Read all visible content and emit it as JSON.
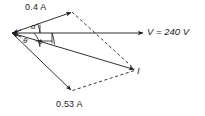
{
  "diagram": {
    "stroke_color": "#1a1a1a",
    "background": "#ffffff",
    "labels": {
      "branch_current_1": "0.4 A",
      "branch_current_2": "0.53 A",
      "voltage": "V = 240 V",
      "total_current": "I",
      "angle_alpha": "α",
      "angle_theta": "θ",
      "angle_phi": "ϕ"
    },
    "vectors": [
      {
        "name": "voltage-reference",
        "label": "V = 240 V",
        "from": [
          12,
          33
        ],
        "to": [
          144,
          33
        ],
        "style": "solid"
      },
      {
        "name": "current-branch-1",
        "label": "0.4 A",
        "from": [
          12,
          33
        ],
        "to": [
          72,
          12
        ],
        "style": "solid"
      },
      {
        "name": "current-branch-2",
        "label": "0.53 A",
        "from": [
          12,
          33
        ],
        "to": [
          72,
          91
        ],
        "style": "solid"
      },
      {
        "name": "current-total",
        "label": "I",
        "from": [
          12,
          33
        ],
        "to": [
          135,
          70
        ],
        "style": "solid"
      }
    ],
    "construction_lines": [
      {
        "name": "parallelogram-upper",
        "from": [
          72,
          12
        ],
        "to": [
          135,
          70
        ],
        "style": "dashed"
      },
      {
        "name": "parallelogram-lower",
        "from": [
          72,
          91
        ],
        "to": [
          135,
          70
        ],
        "style": "dashed"
      }
    ],
    "angle_arcs": [
      {
        "name": "alpha-arc",
        "label": "α",
        "between": [
          "voltage-reference",
          "current-branch-1"
        ]
      },
      {
        "name": "theta-arc",
        "label": "θ",
        "between": [
          "voltage-reference",
          "current-branch-2"
        ]
      },
      {
        "name": "phi-arc",
        "label": "ϕ",
        "between": [
          "voltage-reference",
          "current-total"
        ]
      }
    ]
  }
}
